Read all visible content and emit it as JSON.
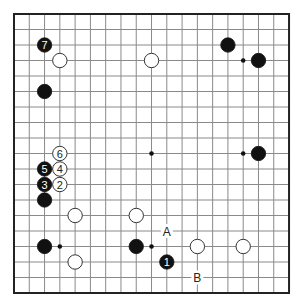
{
  "diagram": {
    "type": "go-board",
    "size": 19,
    "colors": {
      "line": "#8a8a8a",
      "border": "#222222",
      "black": "#111111",
      "white": "#ffffff",
      "background": "#ffffff"
    },
    "geometry": {
      "x0": 14,
      "y0": 14,
      "dx": 15.28,
      "dy": 15.5,
      "stone_r": 7.2
    },
    "star_points": [
      [
        3,
        3
      ],
      [
        9,
        3
      ],
      [
        15,
        3
      ],
      [
        3,
        9
      ],
      [
        9,
        9
      ],
      [
        15,
        9
      ],
      [
        3,
        15
      ],
      [
        9,
        15
      ],
      [
        15,
        15
      ]
    ],
    "stones": [
      {
        "color": "black",
        "col": 2,
        "row": 2,
        "label": "7"
      },
      {
        "color": "white",
        "col": 3,
        "row": 3,
        "label": ""
      },
      {
        "color": "white",
        "col": 9,
        "row": 3,
        "label": ""
      },
      {
        "color": "black",
        "col": 14,
        "row": 2,
        "label": ""
      },
      {
        "color": "black",
        "col": 16,
        "row": 3,
        "label": ""
      },
      {
        "color": "black",
        "col": 2,
        "row": 5,
        "label": ""
      },
      {
        "color": "white",
        "col": 3,
        "row": 9,
        "label": "6"
      },
      {
        "color": "black",
        "col": 16,
        "row": 9,
        "label": ""
      },
      {
        "color": "black",
        "col": 2,
        "row": 10,
        "label": "5"
      },
      {
        "color": "white",
        "col": 3,
        "row": 10,
        "label": "4"
      },
      {
        "color": "black",
        "col": 2,
        "row": 11,
        "label": "3"
      },
      {
        "color": "white",
        "col": 3,
        "row": 11,
        "label": "2"
      },
      {
        "color": "black",
        "col": 2,
        "row": 12,
        "label": ""
      },
      {
        "color": "white",
        "col": 4,
        "row": 13,
        "label": ""
      },
      {
        "color": "white",
        "col": 8,
        "row": 13,
        "label": ""
      },
      {
        "color": "black",
        "col": 2,
        "row": 15,
        "label": ""
      },
      {
        "color": "black",
        "col": 8,
        "row": 15,
        "label": ""
      },
      {
        "color": "white",
        "col": 12,
        "row": 15,
        "label": ""
      },
      {
        "color": "white",
        "col": 15,
        "row": 15,
        "label": ""
      },
      {
        "color": "white",
        "col": 4,
        "row": 16,
        "label": ""
      },
      {
        "color": "black",
        "col": 10,
        "row": 16,
        "label": "1"
      }
    ],
    "point_labels": [
      {
        "text": "A",
        "col": 10,
        "row": 14
      },
      {
        "text": "B",
        "col": 12,
        "row": 17
      }
    ]
  }
}
